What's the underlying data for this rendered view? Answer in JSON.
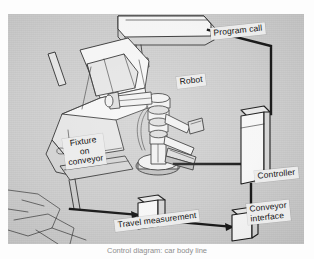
{
  "figure": {
    "kind": "technical-illustration",
    "caption": "Control diagram: car body line",
    "plate_background": "#c9c9c9",
    "ink_color": "#141414",
    "box_fill": "#f2f2f2",
    "label_chip_fill": "#ececec"
  },
  "labels": {
    "program_call": "Program call",
    "robot": "Robot",
    "fixture_on_conveyor": "Fixture\non\nconveyor",
    "controller": "Controller",
    "conveyor_interface": "Conveyor\ninterface",
    "travel_measurement": "Travel measurement"
  },
  "components": [
    {
      "id": "overhead-conveyor-carrier",
      "label": ""
    },
    {
      "id": "car-body",
      "label": ""
    },
    {
      "id": "robot-manipulator",
      "label": "Robot"
    },
    {
      "id": "controller-cabinet",
      "label": "Controller"
    },
    {
      "id": "conveyor-interface-box",
      "label": "Conveyor interface"
    },
    {
      "id": "travel-measurement-box",
      "label": "Travel measurement"
    }
  ],
  "connections": [
    {
      "from": "overhead-conveyor-carrier",
      "to": "controller-cabinet",
      "label": "Program call"
    },
    {
      "from": "robot-manipulator",
      "to": "controller-cabinet",
      "label": ""
    },
    {
      "from": "controller-cabinet",
      "to": "conveyor-interface-box",
      "label": ""
    },
    {
      "from": "travel-measurement-box",
      "to": "conveyor-interface-box",
      "label": ""
    },
    {
      "from": "car-body",
      "to": "travel-measurement-box",
      "label": ""
    }
  ]
}
